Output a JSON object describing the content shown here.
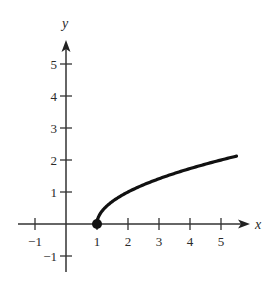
{
  "chart_data": {
    "type": "line",
    "title": "",
    "function": "y = sqrt(x - 1)",
    "xlabel": "x",
    "ylabel": "y",
    "xlim": [
      -1.5,
      5.9
    ],
    "ylim": [
      -1.5,
      5.8
    ],
    "x_ticks": [
      -1,
      1,
      2,
      3,
      4,
      5
    ],
    "y_ticks": [
      -1,
      1,
      2,
      3,
      4,
      5
    ],
    "x_tick_labels": [
      "−1",
      "1",
      "2",
      "3",
      "4",
      "5"
    ],
    "y_tick_labels": [
      "−1",
      "1",
      "2",
      "3",
      "4",
      "5"
    ],
    "grid": false,
    "legend": null,
    "series": [
      {
        "name": "curve",
        "x": [
          1,
          1.1,
          1.25,
          1.5,
          2,
          2.5,
          3,
          3.5,
          4,
          4.5,
          5,
          5.5
        ],
        "y": [
          0,
          0.32,
          0.5,
          0.71,
          1,
          1.22,
          1.41,
          1.58,
          1.73,
          1.87,
          2,
          2.12
        ]
      }
    ],
    "annotations": [
      {
        "type": "closed-dot",
        "x": 1,
        "y": 0
      }
    ],
    "colors": {
      "axis": "#333333",
      "curve": "#111111",
      "text": "#2a2a2a"
    }
  }
}
